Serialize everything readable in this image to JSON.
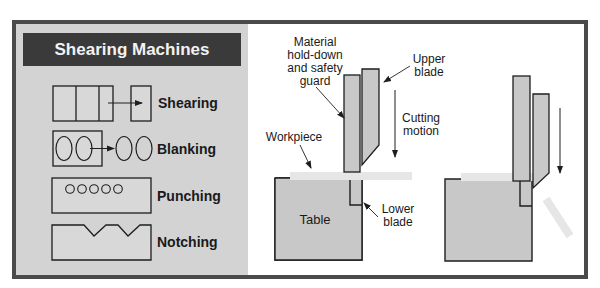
{
  "title": "Shearing Machines",
  "operations": [
    {
      "label": "Shearing"
    },
    {
      "label": "Blanking"
    },
    {
      "label": "Punching"
    },
    {
      "label": "Notching"
    }
  ],
  "callouts": {
    "hold_down": "Material hold-down and safety guard",
    "hold_down_lines": [
      "Material",
      "hold-down",
      "and safety",
      "guard"
    ],
    "upper_blade_lines": [
      "Upper",
      "blade"
    ],
    "cutting_motion_lines": [
      "Cutting",
      "motion"
    ],
    "workpiece": "Workpiece",
    "table": "Table",
    "lower_blade_lines": [
      "Lower",
      "blade"
    ]
  },
  "colors": {
    "frame": "#4a4a4a",
    "left_panel_bg": "#d3d3d3",
    "title_bg": "#3a3a3a",
    "part_fill": "#c8c8c8",
    "workpiece_fill": "#e6e6e6",
    "stroke": "#1e1e1e"
  }
}
